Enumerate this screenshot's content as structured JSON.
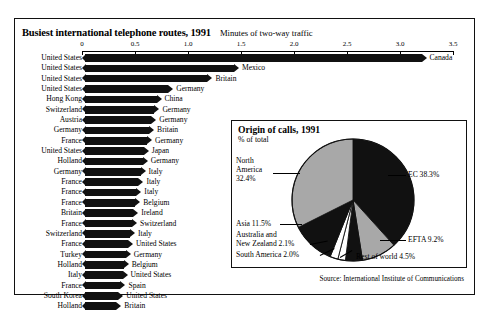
{
  "figure": {
    "title": "Busiest international telephone routes, 1991",
    "subtitle": "Minutes of two-way traffic",
    "source": "Source: International Institute of Communications"
  },
  "chart_data": [
    {
      "type": "bar",
      "title": "Busiest international telephone routes, 1991",
      "xlabel": "Minutes of two-way traffic",
      "ylabel": "",
      "xlim": [
        0,
        3.5
      ],
      "ticks": [
        "0",
        "0.5",
        "1.0",
        "1.5",
        "2.0",
        "2.5",
        "3.0",
        "3.5"
      ],
      "tick_values": [
        0,
        0.5,
        1.0,
        1.5,
        2.0,
        2.5,
        3.0,
        3.5
      ],
      "grid": false,
      "orientation": "horizontal",
      "origins": [
        "United States",
        "United States",
        "United States",
        "United States",
        "Hong Kong",
        "Switzerland",
        "Austria",
        "Germany",
        "France",
        "United States",
        "Holland",
        "Germany",
        "France",
        "France",
        "France",
        "Britain",
        "France",
        "Switzerland",
        "France",
        "Turkey",
        "Holland",
        "Italy",
        "France",
        "South Korea",
        "Holland"
      ],
      "destinations": [
        "Canada",
        "Mexico",
        "Britain",
        "Germany",
        "China",
        "Germany",
        "Germany",
        "Britain",
        "Germany",
        "Japan",
        "Germany",
        "Italy",
        "Italy",
        "Italy",
        "Belgium",
        "Ireland",
        "Switzerland",
        "Italy",
        "United States",
        "Germany",
        "Belgium",
        "United States",
        "Spain",
        "United States",
        "Britain"
      ],
      "values": [
        3.25,
        1.48,
        1.23,
        0.86,
        0.75,
        0.73,
        0.7,
        0.68,
        0.66,
        0.63,
        0.62,
        0.6,
        0.58,
        0.56,
        0.55,
        0.53,
        0.52,
        0.5,
        0.48,
        0.46,
        0.44,
        0.43,
        0.41,
        0.39,
        0.37
      ]
    },
    {
      "type": "pie",
      "title": "Origin of calls, 1991",
      "subtitle": "% of total",
      "labels": [
        "EC",
        "EFTA",
        "Rest of world",
        "South America",
        "Australia and New Zealand",
        "Asia",
        "North America"
      ],
      "values": [
        38.3,
        9.2,
        4.5,
        2.0,
        2.1,
        11.5,
        32.4
      ],
      "legend_position": "callout"
    }
  ],
  "pie": {
    "title": "Origin of calls, 1991",
    "subtitle": "% of total",
    "slices": [
      {
        "name": "ec",
        "label": "EC 38.3%",
        "value": 38.3,
        "color": "#111111"
      },
      {
        "name": "efta",
        "label": "EFTA 9.2%",
        "value": 9.2,
        "color": "#a8a8a8"
      },
      {
        "name": "rest-of-world",
        "label": "Rest of world 4.5%",
        "value": 4.5,
        "color": "#111111"
      },
      {
        "name": "south-america",
        "label": "South America 2.0%",
        "value": 2.0,
        "color": "#ffffff"
      },
      {
        "name": "australia-new-zealand",
        "label": "Australia and\nNew Zealand 2.1%",
        "value": 2.1,
        "color": "#ffffff"
      },
      {
        "name": "asia",
        "label": "Asia 11.5%",
        "value": 11.5,
        "color": "#111111"
      },
      {
        "name": "north-america",
        "label": "North\nAmerica\n32.4%",
        "value": 32.4,
        "color": "#a8a8a8"
      }
    ],
    "labels": {
      "north_america_l1": "North",
      "north_america_l2": "America",
      "north_america_l3": "32.4%",
      "asia": "Asia 11.5%",
      "anz_l1": "Australia and",
      "anz_l2": "New Zealand 2.1%",
      "south_america": "South America 2.0%",
      "ec": "EC 38.3%",
      "efta": "EFTA 9.2%",
      "rest_of_world": "Rest of world 4.5%"
    }
  },
  "colors": {
    "ink": "#111111",
    "grey": "#a8a8a8",
    "paper": "#ffffff"
  }
}
